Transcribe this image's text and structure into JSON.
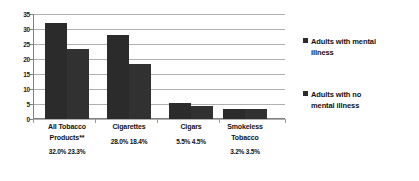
{
  "chart_data": {
    "type": "bar",
    "title": "",
    "xlabel": "",
    "ylabel": "",
    "ylim": [
      0,
      35
    ],
    "ytick_step": 5,
    "yticks": [
      "0",
      "5",
      "10",
      "15",
      "20",
      "25",
      "30",
      "35"
    ],
    "grid": true,
    "legend_position": "right",
    "categories": [
      "All Tobacco\nProducts**",
      "Cigarettes",
      "Cigars",
      "Smokeless\nTobacco"
    ],
    "series": [
      {
        "name": "Adults with mental\nillness",
        "values": [
          32.0,
          28.0,
          5.5,
          3.2
        ],
        "color": "#2b2b2b"
      },
      {
        "name": "Adults with no\nmental illness",
        "values": [
          23.3,
          18.4,
          4.5,
          3.5
        ],
        "color": "#313131"
      }
    ],
    "value_labels": [
      "32.0%  23.3%",
      "28.0%  18.4%",
      "5.5%  4.5%",
      "3.2%  3.5%"
    ]
  },
  "legend": {
    "entries": [
      {
        "label": "Adults with mental\nillness"
      },
      {
        "label": "Adults with no\nmental illness"
      }
    ]
  }
}
